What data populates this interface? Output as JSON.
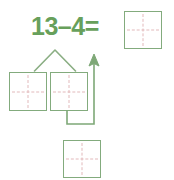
{
  "page": {
    "background_color": "#ffffff"
  },
  "colors": {
    "text_green": "#67a05b",
    "square_border_green": "#83ab7d",
    "connector_green": "#7ea877",
    "grid_dash_pink": "#e2b9bb"
  },
  "equation": {
    "minuend": "13",
    "minus_sign": "–",
    "subtrahend": "4",
    "equals_sign": "=",
    "full_text": "13–4="
  },
  "squares": [
    {
      "id": "answer",
      "role": "answer-box",
      "value": "",
      "has_crosshair": true
    },
    {
      "id": "left",
      "role": "part-box-left",
      "value": "",
      "has_crosshair": true
    },
    {
      "id": "right",
      "role": "part-box-right",
      "value": "",
      "has_crosshair": true
    },
    {
      "id": "bottom",
      "role": "result-box",
      "value": "",
      "has_crosshair": true
    }
  ],
  "connectors": {
    "branch": {
      "name": "number-bond-branch",
      "shape": "inverted-v"
    },
    "arrow": {
      "name": "result-arrow",
      "direction": "up",
      "shape": "elbow-with-arrowhead"
    }
  }
}
